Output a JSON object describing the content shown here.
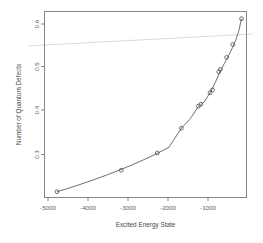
{
  "chart_data": {
    "type": "scatter",
    "title": "",
    "subtitle": "",
    "xlabel": "Excited Energy State",
    "ylabel": "Number of Quantum Defects",
    "xlim": [
      -5200,
      -330
    ],
    "ylim": [
      0.243,
      0.632
    ],
    "grid": false,
    "legend": null,
    "x_ticks": [
      -5000,
      -4000,
      -3000,
      -2000,
      -1000
    ],
    "x_tick_labels": [
      "-5000",
      "-4000",
      "-3000",
      "-2000",
      "-1000"
    ],
    "y_ticks": [
      0.3,
      0.4,
      0.5,
      0.6
    ],
    "y_tick_labels": [
      "0.3",
      "0.4",
      "0.5",
      "0.6"
    ],
    "series": [
      {
        "name": "observed points",
        "marker": "open-circle",
        "color": "#4d4d4d",
        "x": [
          -4900,
          -3350,
          -2480,
          -1900,
          -1490,
          -1430,
          -1210,
          -1150,
          -1000,
          -960,
          -810,
          -660,
          -450
        ],
        "y": [
          0.255,
          0.3,
          0.336,
          0.388,
          0.434,
          0.438,
          0.462,
          0.468,
          0.506,
          0.511,
          0.536,
          0.563,
          0.617
        ]
      },
      {
        "name": "fitted curve",
        "marker": "none",
        "color": "#555555",
        "x": [
          -4900,
          -4600,
          -4300,
          -4000,
          -3700,
          -3400,
          -3100,
          -2800,
          -2500,
          -2200,
          -1900,
          -1700,
          -1500,
          -1350,
          -1200,
          -1080,
          -960,
          -860,
          -760,
          -670,
          -590,
          -520,
          -450
        ],
        "y": [
          0.255,
          0.263,
          0.2715,
          0.2805,
          0.29,
          0.3,
          0.3108,
          0.3222,
          0.3345,
          0.348,
          0.388,
          0.406,
          0.432,
          0.443,
          0.463,
          0.484,
          0.508,
          0.524,
          0.54,
          0.556,
          0.572,
          0.59,
          0.617
        ]
      },
      {
        "name": "reference line",
        "marker": "none",
        "color": "#d2d2d2",
        "x": [
          -5600,
          -180
        ],
        "y": [
          0.56,
          0.585
        ]
      }
    ]
  },
  "axes": {
    "x_axis_title": "Excited Energy State",
    "y_axis_title": "Number of Quantum Defects"
  }
}
